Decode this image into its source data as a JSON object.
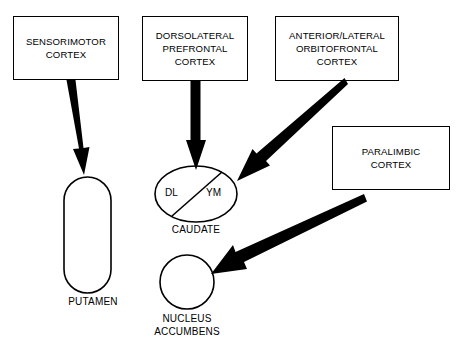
{
  "diagram": {
    "background_color": "#ffffff",
    "line_color": "#000000",
    "cortex_nodes": [
      {
        "id": "sensorimotor",
        "label": "SENSORIMOTOR\nCORTEX",
        "shape": "rectangle",
        "x": 13,
        "y": 16,
        "width": 106,
        "height": 64
      },
      {
        "id": "dorsolateral-prefrontal",
        "label": "DORSOLATERAL\nPREFRONTAL\nCORTEX",
        "shape": "rectangle",
        "x": 142,
        "y": 16,
        "width": 106,
        "height": 65
      },
      {
        "id": "anterior-lateral-orbitofrontal",
        "label": "ANTERIOR/LATERAL\nORBITOFRONTAL\nCORTEX",
        "shape": "rectangle",
        "x": 275,
        "y": 16,
        "width": 124,
        "height": 65
      },
      {
        "id": "paralimbic",
        "label": "PARALIMBIC\nCORTEX",
        "shape": "rectangle",
        "x": 332,
        "y": 126,
        "width": 118,
        "height": 64
      }
    ],
    "striatal_nodes": [
      {
        "id": "putamen",
        "label": "PUTAMEN",
        "shape": "stadium",
        "x": 64,
        "y": 177,
        "width": 47,
        "height": 116,
        "label_x": 93,
        "label_y": 296
      },
      {
        "id": "caudate",
        "label": "CAUDATE",
        "shape": "ellipse",
        "cx": 196,
        "cy": 194,
        "rx": 41,
        "ry": 28,
        "label_x": 196,
        "label_y": 224,
        "sectors": [
          {
            "id": "caudate-dl",
            "text": "DL",
            "x": 175,
            "y": 193
          },
          {
            "id": "caudate-ym",
            "text": "YM",
            "x": 216,
            "y": 193
          }
        ],
        "divider": {
          "x1": 172,
          "y1": 216,
          "x2": 222,
          "y2": 172
        }
      },
      {
        "id": "nucleus-accumbens",
        "label": "NUCLEUS\nACCUMBENS",
        "shape": "circle",
        "cx": 187,
        "cy": 282,
        "r": 27,
        "label_x": 187,
        "label_y": 313
      }
    ],
    "connections": [
      {
        "id": "sensorimotor-to-putamen",
        "from": "sensorimotor",
        "to": "putamen",
        "style": "tapered-arrow",
        "x1": 70,
        "y1": 80,
        "x2": 84,
        "y2": 175,
        "tail_width": 9,
        "head_width": 19,
        "head_length": 30
      },
      {
        "id": "dorsolateral-prefrontal-to-caudate",
        "from": "dorsolateral-prefrontal",
        "to": "caudate",
        "style": "tapered-arrow",
        "x1": 195,
        "y1": 81,
        "x2": 196,
        "y2": 170,
        "tail_width": 9,
        "head_width": 19,
        "head_length": 30
      },
      {
        "id": "orbitofrontal-to-caudate",
        "from": "anterior-lateral-orbitofrontal",
        "to": "caudate",
        "style": "tapered-arrow",
        "x1": 341,
        "y1": 81,
        "x2": 237,
        "y2": 181,
        "tail_width": 8,
        "head_width": 19,
        "head_length": 31
      },
      {
        "id": "paralimbic-to-nucleus-accumbens",
        "from": "paralimbic",
        "to": "nucleus-accumbens",
        "style": "tapered-arrow",
        "x1": 362,
        "y1": 199,
        "x2": 211,
        "y2": 274,
        "tail_width": 8,
        "head_width": 19,
        "head_length": 32
      }
    ]
  }
}
